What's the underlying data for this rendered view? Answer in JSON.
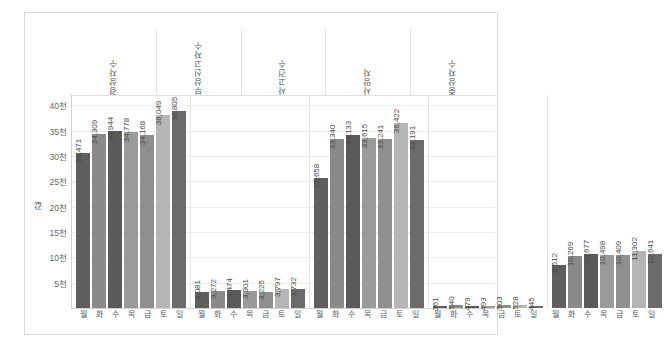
{
  "chart_data": {
    "type": "bar",
    "title": "",
    "subtitle": "",
    "xlabel": "",
    "ylabel": "값",
    "ylim": [
      0,
      42000
    ],
    "grid": true,
    "legend": false,
    "y_ticks": [
      "5천",
      "10천",
      "15천",
      "20천",
      "25천",
      "30천",
      "35천",
      "40천"
    ],
    "y_tick_values": [
      5000,
      10000,
      15000,
      20000,
      25000,
      30000,
      35000,
      40000
    ],
    "categories": [
      "월",
      "화",
      "수",
      "목",
      "금",
      "토",
      "일"
    ],
    "groups": [
      {
        "name": "경상자수",
        "categories": [
          "월",
          "화",
          "수",
          "목",
          "금",
          "토",
          "일"
        ],
        "values": [
          30471,
          34309,
          34944,
          34778,
          34168,
          38049,
          38805
        ],
        "labels": [
          "30,471",
          "34,309",
          "34,944",
          "34,778",
          "34,168",
          "38,049",
          "38,805"
        ]
      },
      {
        "name": "부상신고자수",
        "categories": [
          "월",
          "화",
          "수",
          "목",
          "금",
          "토",
          "일"
        ],
        "values": [
          3081,
          3272,
          3474,
          3301,
          3225,
          3797,
          3732
        ],
        "labels": [
          "3,081",
          "3,272",
          "3,474",
          "3,301",
          "3,225",
          "3,797",
          "3,732"
        ]
      },
      {
        "name": "사고건수",
        "categories": [
          "월",
          "화",
          "수",
          "목",
          "금",
          "토",
          "일"
        ],
        "values": [
          25658,
          33340,
          34133,
          33615,
          33241,
          36422,
          33191
        ],
        "labels": [
          "25,658",
          "33,340",
          "34,133",
          "33,615",
          "33,241",
          "36,422",
          "33,191"
        ]
      },
      {
        "name": "사망자",
        "categories": [
          "월",
          "화",
          "수",
          "목",
          "금",
          "토",
          "일"
        ],
        "values": [
          361,
          540,
          479,
          493,
          503,
          528,
          445
        ],
        "labels": [
          "361",
          "540",
          "479",
          "493",
          "503",
          "528",
          "445"
        ]
      },
      {
        "name": "중상자수",
        "categories": [
          "월",
          "화",
          "수",
          "목",
          "금",
          "토",
          "일"
        ],
        "values": [
          8512,
          10269,
          10677,
          10498,
          10409,
          11302,
          10641
        ],
        "labels": [
          "8,512",
          "10,269",
          "10,677",
          "10,498",
          "10,409",
          "11,302",
          "10,641"
        ]
      }
    ],
    "bar_colors": [
      "#5f5f5f",
      "#8a8a8a",
      "#5a5a5a",
      "#9a9a9a",
      "#8f8f8f",
      "#b5b5b5",
      "#6b6b6b"
    ]
  }
}
